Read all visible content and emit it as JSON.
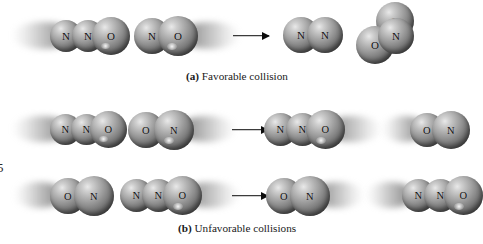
{
  "figure": {
    "style": "space-filling molecular models, grayscale",
    "captions": [
      {
        "tag": "(a)",
        "text": "Favorable collision"
      },
      {
        "tag": "(b)",
        "text": "Unfavorable collisions"
      }
    ]
  },
  "atom_labels": {
    "nitrogen": "N",
    "oxygen": "O"
  },
  "rows": [
    {
      "id": "row-favorable",
      "caption_index": 0,
      "reactants": [
        {
          "name": "dinitrogen-monoxide",
          "atoms": [
            "N",
            "N",
            "O"
          ],
          "motion": "right",
          "trail": "left"
        },
        {
          "name": "nitrogen-monoxide",
          "atoms": [
            "N",
            "O"
          ],
          "motion": "left",
          "trail": "right"
        }
      ],
      "arrow": "reaction-arrow",
      "products": [
        {
          "name": "dinitrogen",
          "atoms": [
            "N",
            "N"
          ],
          "motion": "none",
          "trail": "none"
        },
        {
          "name": "nitrogen-dioxide",
          "atoms": [
            "O",
            "N",
            "O"
          ],
          "geometry": "bent",
          "motion": "none",
          "trail": "none"
        }
      ]
    },
    {
      "id": "row-unfavorable-1",
      "caption_index": 1,
      "reactants": [
        {
          "name": "dinitrogen-monoxide",
          "atoms": [
            "N",
            "N",
            "O"
          ],
          "motion": "right",
          "trail": "left"
        },
        {
          "name": "nitrogen-monoxide",
          "atoms": [
            "O",
            "N"
          ],
          "motion": "left",
          "trail": "right"
        }
      ],
      "arrow": "reaction-arrow",
      "products": [
        {
          "name": "dinitrogen-monoxide",
          "atoms": [
            "N",
            "N",
            "O"
          ],
          "motion": "right",
          "trail": "right"
        },
        {
          "name": "nitrogen-monoxide",
          "atoms": [
            "O",
            "N"
          ],
          "motion": "right",
          "trail": "left"
        }
      ]
    },
    {
      "id": "row-unfavorable-2",
      "caption_index": 1,
      "reactants": [
        {
          "name": "nitrogen-monoxide",
          "atoms": [
            "O",
            "N"
          ],
          "motion": "right",
          "trail": "left"
        },
        {
          "name": "dinitrogen-monoxide",
          "atoms": [
            "N",
            "N",
            "O"
          ],
          "motion": "left",
          "trail": "right"
        }
      ],
      "arrow": "reaction-arrow",
      "products": [
        {
          "name": "nitrogen-monoxide",
          "atoms": [
            "O",
            "N"
          ],
          "motion": "left",
          "trail": "right"
        },
        {
          "name": "dinitrogen-monoxide",
          "atoms": [
            "N",
            "N",
            "O"
          ],
          "motion": "right",
          "trail": "left"
        }
      ]
    }
  ],
  "edge_artifact": {
    "text": "5"
  },
  "colors": {
    "background": "#ffffff",
    "atom_light": "#e9e9e9",
    "atom_mid": "#949494",
    "atom_dark": "#333333",
    "label_text": "#101010",
    "arrow": "#0b0b0b"
  }
}
